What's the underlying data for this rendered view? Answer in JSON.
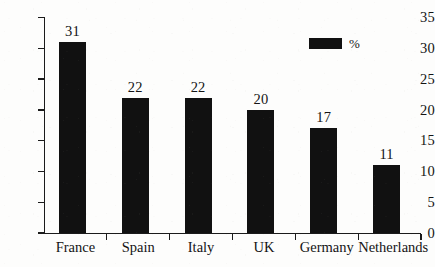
{
  "chart_data": {
    "type": "bar",
    "title": "",
    "subtitle": "",
    "xlabel": "",
    "ylabel": "",
    "categories": [
      "France",
      "Spain",
      "Italy",
      "UK",
      "Germany",
      "Netherlands"
    ],
    "values": [
      31,
      22,
      22,
      20,
      17,
      11
    ],
    "value_labels": [
      "31",
      "22",
      "22",
      "20",
      "17",
      "11"
    ],
    "ylim": [
      0,
      35
    ],
    "ytick_step": 5,
    "ytick_labels": [
      "0",
      "5",
      "10",
      "15",
      "20",
      "25",
      "30",
      "35"
    ],
    "ytick_values": [
      0,
      5,
      10,
      15,
      20,
      25,
      30,
      35
    ],
    "grid": false,
    "legend": {
      "position": "top-right",
      "entries": [
        {
          "label": "%",
          "color": "#111111",
          "swatch": "filled-rectangle"
        }
      ]
    },
    "series": [
      {
        "name": "%",
        "color": "#111111",
        "values": [
          31,
          22,
          22,
          20,
          17,
          11
        ]
      }
    ],
    "colors": {
      "bar": "#111111",
      "axis": "#1b1b1b",
      "text": "#141414",
      "background": "#fdfdfc"
    },
    "annotations": []
  }
}
